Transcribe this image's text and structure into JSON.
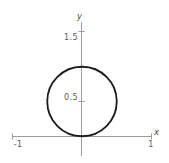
{
  "figure": {
    "width": 169,
    "height": 163,
    "background": "#ffffff"
  },
  "axes": {
    "x_name": "x",
    "y_name": "y",
    "axis_color": "#9b9b9b",
    "label_color": "#5a5a5a",
    "x_ticks": [
      {
        "label": "-1",
        "value": -1
      },
      {
        "label": "1",
        "value": 1
      }
    ],
    "y_ticks": [
      {
        "label": "0.5",
        "value": 0.5
      },
      {
        "label": "1.5",
        "value": 1.5
      }
    ]
  },
  "chart_data": {
    "type": "line",
    "title": "",
    "xlabel": "x",
    "ylabel": "y",
    "xlim": [
      -1.15,
      1.25
    ],
    "ylim": [
      -0.28,
      1.72
    ],
    "grid": false,
    "legend": null,
    "xticks": [
      -1,
      1
    ],
    "xticklabels": [
      "-1",
      "1"
    ],
    "yticks": [
      0.5,
      1.5
    ],
    "yticklabels": [
      "0.5",
      "1.5"
    ],
    "series": [
      {
        "name": "circle",
        "shape": "circle",
        "center": [
          0,
          0.5
        ],
        "radius": 0.5,
        "color": "#1a1a1a",
        "linewidth": 1.8,
        "fill": "none",
        "closed": true,
        "description": "Circle of radius 0.5 centred at (0, 0.5), tangent to the x-axis at the origin"
      }
    ]
  }
}
